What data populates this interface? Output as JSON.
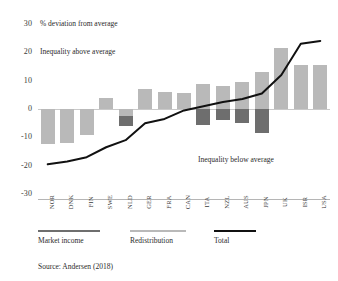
{
  "chart_data": {
    "type": "bar",
    "title": "",
    "subtitle": "",
    "axis_note": "% deviation from average",
    "xlabel": "",
    "ylabel": "",
    "ylim": [
      -30,
      30
    ],
    "yticks": [
      "30",
      "20",
      "10",
      "0",
      "-10",
      "-20",
      "-30"
    ],
    "ytick_values": [
      30,
      20,
      10,
      0,
      -10,
      -20,
      -30
    ],
    "grid": false,
    "zero_line": true,
    "legend_position": "bottom-left",
    "categories": [
      "NOR",
      "DNK",
      "FIN",
      "SWE",
      "NLD",
      "GER",
      "FRA",
      "CAN",
      "ITA",
      "NZL",
      "AUS",
      "JPN",
      "UK",
      "ISR",
      "USA"
    ],
    "series": [
      {
        "name": "Market income",
        "color": "#6e6e6e",
        "values": [
          -7.5,
          -7.5,
          -8.0,
          1.0,
          -6.0,
          3.0,
          4.0,
          4.5,
          -5.5,
          -4.0,
          -5.0,
          -8.5,
          4.5,
          9.0,
          9.0
        ]
      },
      {
        "name": "Redistribution",
        "color": "#b9b9b9",
        "values": [
          -12.5,
          -12.0,
          -9.0,
          4.0,
          -2.5,
          7.0,
          6.0,
          5.5,
          9.0,
          8.0,
          9.5,
          13.0,
          21.5,
          15.5,
          15.5
        ]
      },
      {
        "name": "Total",
        "color": "#111111",
        "type": "line",
        "values": [
          -19.5,
          -18.5,
          -17.0,
          -13.5,
          -11.0,
          -5.0,
          -3.5,
          -0.5,
          1.0,
          2.5,
          3.5,
          5.5,
          12.0,
          23.0,
          24.0
        ]
      }
    ],
    "annotations": [
      {
        "text": "% deviation from average",
        "x": 0.02,
        "y": 30
      },
      {
        "text": "Inequality above average",
        "x": 0.02,
        "y": 20
      },
      {
        "text": "Inequality below average",
        "x": 0.56,
        "y": -16
      }
    ]
  },
  "labels": {
    "deviation_note": "% deviation from average",
    "above_average": "Inequality above average",
    "below_average": "Inequality below average"
  },
  "legend": {
    "items": [
      {
        "label": "Market income",
        "color": "#6e6e6e"
      },
      {
        "label": "Redistribution",
        "color": "#b9b9b9"
      },
      {
        "label": "Total",
        "color": "#111111"
      }
    ]
  },
  "source": {
    "text": "Source: Andersen (2018)"
  }
}
